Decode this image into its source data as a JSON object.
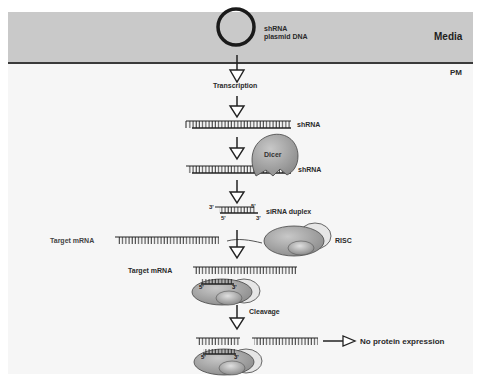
{
  "figure": {
    "compartments": {
      "media_label": "Media",
      "membrane_label": "PM"
    },
    "plasmid": {
      "label_line1": "shRNA",
      "label_line2": "plasmid DNA"
    },
    "steps": {
      "transcription": "Transcription",
      "shrna_1": "shRNA",
      "dicer": "Dicer",
      "shrna_2": "shRNA",
      "sirna_duplex": "siRNA duplex",
      "end_3_left": "3'",
      "end_5_right": "5'",
      "end_5_bottom": "5'",
      "end_3_bottom": "3'",
      "target_mrna_1": "Target mRNA",
      "risc": "RISC",
      "target_mrna_2": "Target mRNA",
      "risc_5": "5'",
      "risc_3": "3'",
      "cleavage": "Cleavage",
      "cleaved_5": "5'",
      "cleaved_3": "3'",
      "outcome": "No protein expression"
    },
    "colors": {
      "media": "#c9c9c9",
      "membrane": "#3a3a3a",
      "cytoplasm": "#f6f6f6",
      "protein_gray": "#9a9a9a",
      "protein_light": "#d8d8d8",
      "strand": "#222222"
    }
  }
}
